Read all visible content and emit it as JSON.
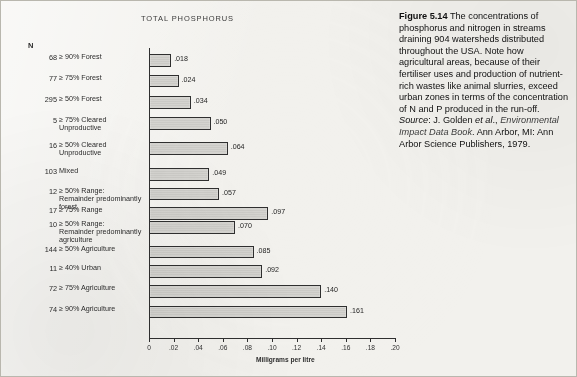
{
  "figure": {
    "label": "Figure 5.14",
    "caption_text": " The concentrations of phosphorus and nitrogen in streams draining 904 watersheds distributed throughout the USA. Note how agricultural areas, because of their fertiliser uses and production of nutrient-rich wastes like animal slurries, exceed urban zones in terms of the concentration of N and P produced in the run-off. ",
    "source_prefix": "Source",
    "source_colon": ": J. Golden ",
    "source_etal": "et al",
    "source_after_etal": ".,",
    "source_book": "Environmental Impact Data Book",
    "source_tail": ". Ann Arbor, MI: Ann Arbor Science Publishers, 1979."
  },
  "chart_data": {
    "type": "bar",
    "orientation": "horizontal",
    "title": "TOTAL PHOSPHORUS",
    "xlabel": "Milligrams per litre",
    "ylabel": "",
    "n_header": "N",
    "xlim": [
      0,
      0.2
    ],
    "xticks": [
      0,
      0.02,
      0.04,
      0.06,
      0.08,
      0.1,
      0.12,
      0.14,
      0.16,
      0.18,
      0.2
    ],
    "xticklabels": [
      "0",
      ".02",
      ".04",
      ".06",
      ".08",
      ".10",
      ".12",
      ".14",
      ".16",
      ".18",
      ".20"
    ],
    "grid": false,
    "legend": "none",
    "categories": [
      "≥ 90% Forest",
      "≥ 75% Forest",
      "≥ 50% Forest",
      "≥ 75% Cleared\nUnproductive",
      "≥ 50% Cleared\nUnproductive",
      "Mixed",
      "≥ 50% Range:\nRemainder predominantly\nforest",
      "≥ 75% Range",
      "≥ 50% Range:\nRemainder predominantly\nagriculture",
      "≥ 50% Agriculture",
      "≥ 40% Urban",
      "≥ 75% Agriculture",
      "≥ 90% Agriculture"
    ],
    "n_values": [
      "68",
      "77",
      "295",
      "5",
      "16",
      "103",
      "12",
      "17",
      "10",
      "144",
      "11",
      "72",
      "74"
    ],
    "values": [
      0.018,
      0.024,
      0.034,
      0.05,
      0.064,
      0.049,
      0.057,
      0.097,
      0.07,
      0.085,
      0.092,
      0.14,
      0.161
    ],
    "value_labels": [
      ".018",
      ".024",
      ".034",
      ".050",
      ".064",
      ".049",
      ".057",
      ".097",
      ".070",
      ".085",
      ".092",
      ".140",
      ".161"
    ]
  }
}
